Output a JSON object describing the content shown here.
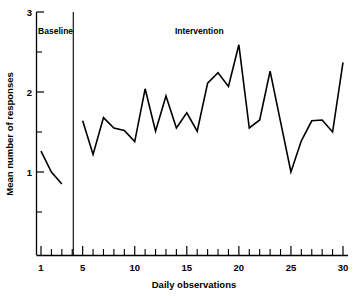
{
  "figure": {
    "background_color": "#ffffff",
    "line_color": "#000000",
    "axis_color": "#000000"
  },
  "labels": {
    "y_axis_title": "Mean number of responses",
    "x_axis_title": "Daily observations",
    "phase_baseline": "Baseline",
    "phase_intervention": "Intervention"
  },
  "chart_data": {
    "type": "line",
    "title": "",
    "xlabel": "Daily observations",
    "ylabel": "Mean number of responses",
    "xlim": [
      0.4,
      30.6
    ],
    "ylim": [
      0.0,
      3.0
    ],
    "grid": false,
    "legend_position": "none",
    "x_tick_labels": [
      "1",
      "5",
      "10",
      "15",
      "20",
      "25",
      "30"
    ],
    "x_tick_values": [
      1,
      5,
      10,
      15,
      20,
      25,
      30
    ],
    "x_minor_ticks": [
      2,
      3,
      4,
      6,
      7,
      8,
      9,
      11,
      12,
      13,
      14,
      16,
      17,
      18,
      19,
      21,
      22,
      23,
      24,
      26,
      27,
      28,
      29
    ],
    "y_tick_labels": [
      "1",
      "2",
      "3"
    ],
    "y_tick_values": [
      1,
      2,
      3
    ],
    "y_minor_ticks": [
      0.5,
      1.5,
      2.5
    ],
    "phase_divider_x": 4.1,
    "annotations": [
      {
        "text": "Baseline",
        "x": 2.4,
        "y": 2.72
      },
      {
        "text": "Intervention",
        "x": 16.2,
        "y": 2.72
      }
    ],
    "series": [
      {
        "name": "Baseline",
        "x": [
          1,
          2,
          3
        ],
        "values": [
          1.26,
          1.0,
          0.85
        ]
      },
      {
        "name": "Intervention",
        "x": [
          5,
          6,
          7,
          8,
          9,
          10,
          11,
          12,
          13,
          14,
          15,
          16,
          17,
          18,
          19,
          20,
          21,
          22,
          23,
          24,
          25,
          26,
          27,
          28,
          29,
          30
        ],
        "values": [
          1.64,
          1.22,
          1.68,
          1.55,
          1.52,
          1.38,
          2.04,
          1.51,
          1.95,
          1.55,
          1.74,
          1.51,
          2.11,
          2.24,
          2.07,
          2.59,
          1.55,
          1.65,
          2.26,
          1.63,
          1.0,
          1.39,
          1.64,
          1.65,
          1.5,
          2.37
        ]
      }
    ]
  }
}
